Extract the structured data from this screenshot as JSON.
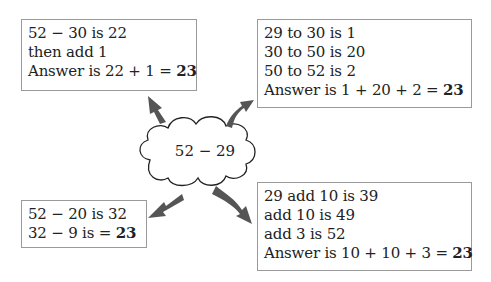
{
  "diagram": {
    "center": {
      "label": "52 − 29",
      "shape": "cloud"
    },
    "boxes": [
      {
        "position": "top-left",
        "lines": [
          "52 − 30 is 22",
          "then add 1",
          "Answer is 22 + 1 = "
        ],
        "answer": "23"
      },
      {
        "position": "top-right",
        "lines": [
          "29 to 30 is 1",
          "30 to 50 is 20",
          "50 to 52 is 2",
          "Answer is 1 + 20 + 2 = "
        ],
        "answer": "23"
      },
      {
        "position": "bottom-left",
        "lines": [
          "52 − 20 is 32",
          "32 − 9 is = "
        ],
        "answer": "23"
      },
      {
        "position": "bottom-right",
        "lines": [
          "29 add 10 is 39",
          "add 10 is 49",
          "add 3 is 52",
          "Answer is 10 + 10 + 3 = "
        ],
        "answer": "23"
      }
    ],
    "colors": {
      "arrow": "#555555",
      "box_border": "#9a9a9a",
      "text": "#222222"
    }
  }
}
